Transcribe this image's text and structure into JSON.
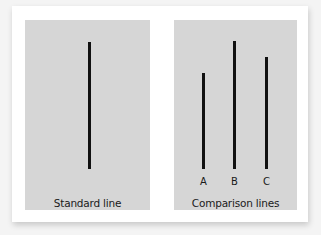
{
  "figure": {
    "panels": [
      {
        "id": "standard",
        "caption": "Standard line",
        "lines": [
          {
            "label": "",
            "top": 22,
            "bottom": 149,
            "x": 64
          }
        ]
      },
      {
        "id": "comparison",
        "caption": "Comparison lines",
        "lines": [
          {
            "label": "A",
            "top": 53,
            "bottom": 149,
            "x": 29
          },
          {
            "label": "B",
            "top": 21,
            "bottom": 149,
            "x": 60
          },
          {
            "label": "C",
            "top": 37,
            "bottom": 149,
            "x": 92
          }
        ]
      }
    ],
    "colors": {
      "page_bg": "#f4f4f4",
      "card_bg": "#ffffff",
      "panel_bg": "#d6d6d6",
      "line": "#111111",
      "text": "#1a1a1a"
    }
  }
}
